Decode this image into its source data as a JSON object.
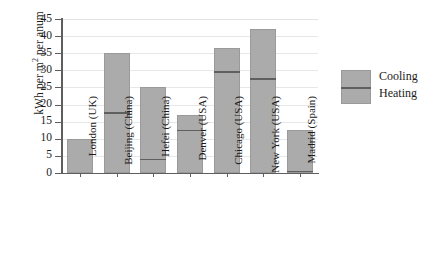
{
  "chart_data": {
    "type": "bar",
    "subtype": "stacked-bar",
    "title": "",
    "xlabel": "",
    "ylabel": "kWh per m2 per anum",
    "ylabel_parts": {
      "prefix": "kWh per m",
      "sup": "2",
      "suffix": " per anum"
    },
    "ylim": [
      0,
      45
    ],
    "ytick_step": 5,
    "yticks": [
      0,
      5,
      10,
      15,
      20,
      25,
      30,
      35,
      40,
      45
    ],
    "ytick_labels": [
      "0",
      "5",
      "10",
      "15",
      "20",
      "25",
      "30",
      "35",
      "40",
      "45"
    ],
    "grid": true,
    "grid_axis": "y",
    "legend_position": "right",
    "categories": [
      "London (UK)",
      "Beijing (China)",
      "Hefei (China)",
      "Denver (USA)",
      "Chicago (USA)",
      "New York (USA)",
      "Madrid (Spain)"
    ],
    "series": [
      {
        "name": "Heating",
        "color": "#ababab",
        "values": [
          10,
          18,
          4.5,
          13,
          30,
          28,
          1
        ]
      },
      {
        "name": "Cooling",
        "color": "#ababab",
        "values": [
          0,
          17,
          20.5,
          4,
          6.5,
          14,
          11.5
        ]
      }
    ],
    "totals": [
      10,
      35,
      25,
      17,
      36.5,
      42,
      12.5
    ]
  },
  "legend": {
    "cooling_label": "Cooling",
    "heating_label": "Heating"
  },
  "colors": {
    "bar_fill": "#ababab",
    "bar_edge": "#9a9a9a",
    "split_line": "#5f5f5f",
    "axis": "#5e5e5e",
    "grid": "#e7e7e7",
    "text": "#1b1b1b",
    "background": "#ffffff"
  }
}
